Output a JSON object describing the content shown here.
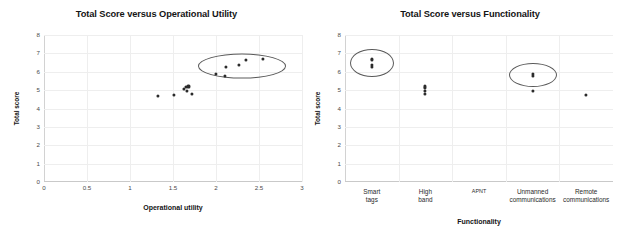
{
  "figure": {
    "background": "#ffffff",
    "point_color": "#2b2b2b",
    "ellipse_color": "#5a5a5a",
    "grid_color": "#eeeeee"
  },
  "chart_data": [
    {
      "type": "scatter",
      "title": "Total Score versus Operational Utility",
      "xlabel": "Operational utility",
      "ylabel": "Total score",
      "xlim": [
        0,
        3
      ],
      "ylim": [
        0,
        8
      ],
      "xticks": [
        "0",
        "0.5",
        "1",
        "1.5",
        "2",
        "2.5",
        "3"
      ],
      "xtick_values": [
        0,
        0.5,
        1,
        1.5,
        2,
        2.5,
        3
      ],
      "yticks": [
        "0",
        "1",
        "2",
        "3",
        "4",
        "5",
        "6",
        "7",
        "8"
      ],
      "ytick_values": [
        0,
        1,
        2,
        3,
        4,
        5,
        6,
        7,
        8
      ],
      "grid": true,
      "legend": "none",
      "points": [
        {
          "x": 1.33,
          "y": 4.7
        },
        {
          "x": 1.51,
          "y": 4.75
        },
        {
          "x": 1.63,
          "y": 5.05
        },
        {
          "x": 1.65,
          "y": 5.15
        },
        {
          "x": 1.66,
          "y": 4.95
        },
        {
          "x": 1.68,
          "y": 5.2
        },
        {
          "x": 1.72,
          "y": 4.78
        },
        {
          "x": 2.0,
          "y": 5.88
        },
        {
          "x": 2.1,
          "y": 5.78
        },
        {
          "x": 2.12,
          "y": 6.25
        },
        {
          "x": 2.27,
          "y": 6.35
        },
        {
          "x": 2.35,
          "y": 6.65
        },
        {
          "x": 2.55,
          "y": 6.7
        }
      ],
      "annotations": [
        {
          "shape": "ellipse",
          "label": "high-performer-cluster",
          "cx": 2.3,
          "cy": 6.3,
          "rx": 0.5,
          "ry": 0.62,
          "rotation_deg": 0
        }
      ]
    },
    {
      "type": "scatter",
      "title": "Total Score versus Functionality",
      "xlabel": "Functionality",
      "ylabel": "Total score",
      "ylim": [
        0,
        8
      ],
      "yticks": [
        "0",
        "1",
        "2",
        "3",
        "4",
        "5",
        "6",
        "7",
        "8"
      ],
      "ytick_values": [
        0,
        1,
        2,
        3,
        4,
        5,
        6,
        7,
        8
      ],
      "grid": true,
      "legend": "none",
      "categories": [
        "Smart tags",
        "High band",
        "APNT",
        "Unmanned communications",
        "Remote communications"
      ],
      "category_lines": [
        [
          "Smart",
          "tags"
        ],
        [
          "High",
          "band"
        ],
        [
          "APNT",
          ""
        ],
        [
          "Unmanned",
          "communications"
        ],
        [
          "Remote",
          "communications"
        ]
      ],
      "series": [
        {
          "category": "Smart tags",
          "values": [
            6.7,
            6.62,
            6.35,
            6.25
          ]
        },
        {
          "category": "High band",
          "values": [
            5.2,
            5.12,
            4.95,
            4.78
          ]
        },
        {
          "category": "APNT",
          "values": []
        },
        {
          "category": "Unmanned communications",
          "values": [
            5.88,
            5.78,
            4.97
          ]
        },
        {
          "category": "Remote communications",
          "values": [
            4.72
          ]
        }
      ],
      "annotations": [
        {
          "shape": "ellipse",
          "label": "smart-tags-cluster",
          "category": "Smart tags",
          "cy": 6.45,
          "rx_px": 21,
          "ry_px": 13
        },
        {
          "shape": "ellipse",
          "label": "unmanned-communications-cluster",
          "category": "Unmanned communications",
          "cy": 5.85,
          "rx_px": 23,
          "ry_px": 11
        }
      ]
    }
  ]
}
